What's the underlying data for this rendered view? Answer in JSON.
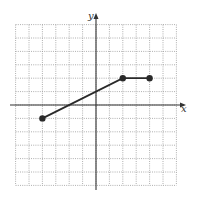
{
  "chart_data": {
    "type": "line",
    "title": "",
    "xlabel": "x",
    "ylabel": "y",
    "xlim": [
      -6,
      6
    ],
    "ylim": [
      -6,
      6
    ],
    "grid": true,
    "grid_style": "dotted",
    "tick_labels": false,
    "series": [
      {
        "name": "piecewise",
        "points": [
          [
            -4,
            -1
          ],
          [
            2,
            2
          ],
          [
            4,
            2
          ]
        ],
        "endpoints": "closed-dots"
      }
    ],
    "colors": {
      "line": "#2a2a2a",
      "grid": "#9a9a9a",
      "axis": "#333333"
    }
  }
}
